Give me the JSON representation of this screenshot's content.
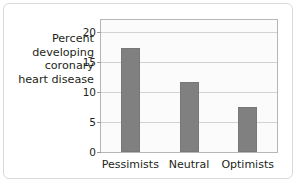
{
  "chart_data": {
    "type": "bar",
    "title": "",
    "subtitle": "",
    "xlabel": "",
    "ylabel": "Percent developing coronary heart disease",
    "ylabel_lines": [
      "Percent",
      "developing",
      "coronary",
      "heart disease"
    ],
    "categories": [
      "Pessimists",
      "Neutral",
      "Optimists"
    ],
    "values": [
      17.3,
      11.7,
      7.5
    ],
    "ylim": [
      0,
      22
    ],
    "yticks": [
      0,
      5,
      10,
      15,
      20
    ],
    "ytick_labels": [
      "0",
      "5",
      "10",
      "15",
      "20"
    ],
    "grid": true,
    "legend": false,
    "legend_position": "none",
    "bar_color": "#808080",
    "plot_background": "#fbfbfb",
    "gridline_color": "#d2d2d2",
    "axis_color": "#b6b6b6",
    "text_color": "#231f20",
    "card_border_color": "#d9d9d9"
  }
}
